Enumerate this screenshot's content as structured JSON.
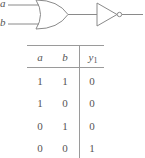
{
  "diagram": {
    "inputs": [
      {
        "label": "a"
      },
      {
        "label": "b"
      }
    ],
    "gates": [
      {
        "type": "OR",
        "icon": "or-gate-icon"
      },
      {
        "type": "NOT",
        "icon": "not-gate-icon"
      }
    ],
    "colors": {
      "stroke": "#8a8a8a",
      "text": "#555555"
    }
  },
  "truth_table": {
    "headers": {
      "a": "a",
      "b": "b",
      "y_base": "y",
      "y_sub": "1"
    },
    "rows": [
      {
        "a": "1",
        "b": "1",
        "y": "0"
      },
      {
        "a": "1",
        "b": "0",
        "y": "0"
      },
      {
        "a": "0",
        "b": "1",
        "y": "0"
      },
      {
        "a": "0",
        "b": "0",
        "y": "1"
      }
    ]
  }
}
